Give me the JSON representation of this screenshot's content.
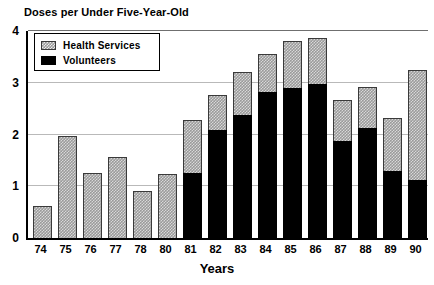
{
  "chart_data": {
    "type": "bar",
    "title": "Doses per Under Five-Year-Old",
    "xlabel": "Years",
    "ylabel": "",
    "ylim": [
      0,
      4
    ],
    "ytick_labels": [
      "0",
      "1",
      "2",
      "3",
      "4"
    ],
    "ytick_values": [
      0,
      1,
      2,
      3,
      4
    ],
    "grid": true,
    "grid_axis": "y",
    "stacked": true,
    "legend_position": "upper-left-inside",
    "categories": [
      "74",
      "75",
      "76",
      "77",
      "78",
      "80",
      "81",
      "82",
      "83",
      "84",
      "85",
      "86",
      "87",
      "88",
      "89",
      "90"
    ],
    "series": [
      {
        "name": "Volunteers",
        "color": "#000000",
        "pattern": "solid",
        "values": [
          0,
          0,
          0,
          0,
          0,
          0,
          1.26,
          2.08,
          2.37,
          2.82,
          2.89,
          2.97,
          1.88,
          2.13,
          1.3,
          1.12
        ]
      },
      {
        "name": "Health Services",
        "color": "#9a9a9a",
        "pattern": "checkerboard",
        "values": [
          0.62,
          1.97,
          1.25,
          1.56,
          0.9,
          1.23,
          1.02,
          0.69,
          0.84,
          0.73,
          0.92,
          0.9,
          0.79,
          0.79,
          1.01,
          2.13
        ]
      }
    ],
    "totals": [
      0.62,
      1.97,
      1.25,
      1.56,
      0.9,
      1.23,
      2.28,
      2.77,
      3.21,
      3.55,
      3.81,
      3.87,
      2.67,
      2.92,
      2.31,
      3.25
    ]
  },
  "legend": {
    "items": [
      {
        "label": "Health Services",
        "swatch": "checkerboard-swatch"
      },
      {
        "label": "Volunteers",
        "swatch": "solid-black-swatch"
      }
    ]
  }
}
